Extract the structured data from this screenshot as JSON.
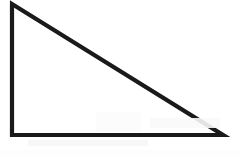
{
  "figure": {
    "shape_name": "right-triangle",
    "background_color": "#ffffff",
    "stroke_color": "#1a1a1a",
    "stroke_width_px": 4,
    "fill": "none",
    "canvas": {
      "width": 240,
      "height": 157
    },
    "vertices": [
      {
        "label": "top-left-apex",
        "x": 12,
        "y": 4
      },
      {
        "label": "bottom-left",
        "x": 12,
        "y": 135
      },
      {
        "label": "bottom-right",
        "x": 223,
        "y": 135
      }
    ],
    "edges": [
      {
        "label": "vertical-leg",
        "from": "top-left-apex",
        "to": "bottom-left",
        "length_px": 131
      },
      {
        "label": "horizontal-leg",
        "from": "bottom-left",
        "to": "bottom-right",
        "length_px": 211
      },
      {
        "label": "hypotenuse",
        "from": "bottom-right",
        "to": "top-left-apex",
        "length_px": 248
      }
    ],
    "right_angle_at": "bottom-left",
    "path_points": "12,4 12,135 223,135 12,4"
  }
}
